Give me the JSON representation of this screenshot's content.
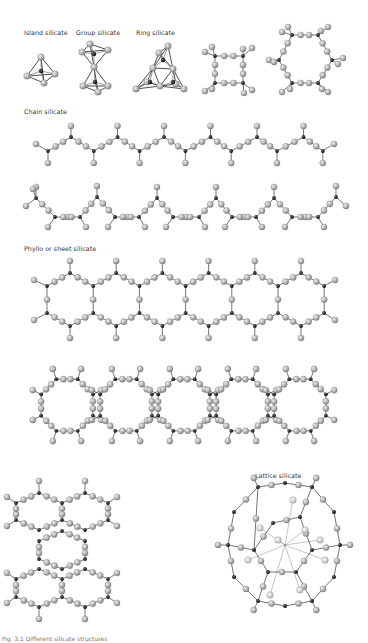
{
  "figure": {
    "labels": {
      "island": "Island silicate",
      "group": "Group silicate",
      "ring": "Ring silicate",
      "chain": "Chain silicate",
      "phyllo": "Phyllo or sheet silicate",
      "lattice": "Lattice silicate"
    },
    "caption": "Fig. 3.1 Different silicate structures",
    "colors": {
      "oxygen_atom": "#b8b8b8",
      "oxygen_highlight": "#e8e8e8",
      "silicon_atom": "#1a1a1a",
      "bond": "#3a3a3a",
      "label_text": "#333333",
      "background": "#ffffff"
    },
    "legend": {
      "silicon": "black sphere = Si",
      "oxygen": "grey sphere = O"
    }
  }
}
